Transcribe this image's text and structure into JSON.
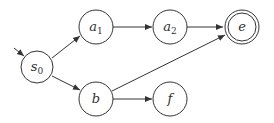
{
  "diagram": {
    "type": "state-machine",
    "nodes": [
      {
        "id": "s0",
        "label": "s",
        "sub": "0",
        "x": 37,
        "y": 67,
        "accepting": false,
        "initial": true
      },
      {
        "id": "a1",
        "label": "a",
        "sub": "1",
        "x": 96,
        "y": 27,
        "accepting": false
      },
      {
        "id": "a2",
        "label": "a",
        "sub": "2",
        "x": 170,
        "y": 27,
        "accepting": false
      },
      {
        "id": "e",
        "label": "e",
        "sub": "",
        "x": 242,
        "y": 27,
        "accepting": true
      },
      {
        "id": "b",
        "label": "b",
        "sub": "",
        "x": 96,
        "y": 99,
        "accepting": false
      },
      {
        "id": "f",
        "label": "f",
        "sub": "",
        "x": 170,
        "y": 99,
        "accepting": false
      }
    ],
    "edges": [
      {
        "from": "s0",
        "to": "a1"
      },
      {
        "from": "s0",
        "to": "b"
      },
      {
        "from": "a1",
        "to": "a2"
      },
      {
        "from": "a2",
        "to": "e"
      },
      {
        "from": "b",
        "to": "e"
      },
      {
        "from": "b",
        "to": "f"
      }
    ],
    "colors": {
      "stroke": "#333333",
      "fill": "#ffffff"
    }
  }
}
